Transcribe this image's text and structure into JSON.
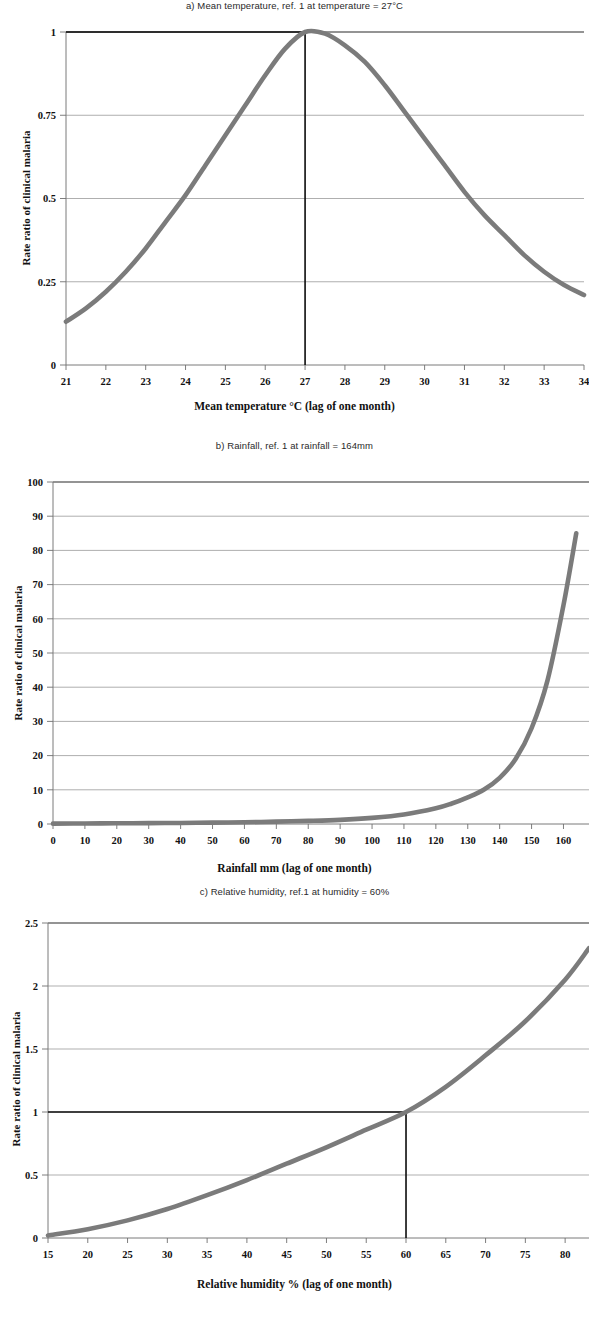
{
  "figure": {
    "panels": [
      {
        "id": "a",
        "title": "a) Mean temperature, ref. 1 at temperature = 27°C",
        "ylabel": "Rate ratio of clinical malaria",
        "xlabel": "Mean temperature °C (lag of one  month)",
        "curve_color": "#7b7b7b"
      },
      {
        "id": "b",
        "title": "b) Rainfall, ref. 1 at rainfall = 164mm",
        "ylabel": "Rate ratio of clinical malaria",
        "xlabel": "Rainfall  mm (lag of one month)",
        "curve_color": "#7b7b7b"
      },
      {
        "id": "c",
        "title": "c) Relative humidity, ref.1 at humidity = 60%",
        "ylabel": "Rate ratio of clinical malaria",
        "xlabel": "Relative humidity % (lag of one month)",
        "curve_color": "#7b7b7b"
      }
    ]
  },
  "chart_data": [
    {
      "type": "line",
      "panel": "a",
      "title": "a) Mean temperature, ref. 1 at temperature = 27°C",
      "xlabel": "Mean temperature °C (lag of one  month)",
      "ylabel": "Rate ratio of clinical malaria",
      "xlim": [
        21,
        34
      ],
      "ylim": [
        0,
        1
      ],
      "xticks": [
        21,
        22,
        23,
        24,
        25,
        26,
        27,
        28,
        29,
        30,
        31,
        32,
        33,
        34
      ],
      "yticks": [
        0,
        0.25,
        0.5,
        0.75,
        1
      ],
      "ytick_labels": [
        "0",
        "0.25",
        "0.5",
        "0.75",
        "1"
      ],
      "grid": "horizontal",
      "legend": "none",
      "reference_lines": {
        "vertical_x": 27,
        "horizontal_y": 1,
        "note": "ref. 1 at temperature = 27°C"
      },
      "x": [
        21,
        21.5,
        22,
        22.5,
        23,
        23.5,
        24,
        24.5,
        25,
        25.5,
        26,
        26.5,
        27,
        27.5,
        28,
        28.5,
        29,
        29.5,
        30,
        30.5,
        31,
        31.5,
        32,
        32.5,
        33,
        33.5,
        34
      ],
      "y": [
        0.13,
        0.17,
        0.22,
        0.28,
        0.35,
        0.43,
        0.51,
        0.6,
        0.69,
        0.78,
        0.87,
        0.95,
        1.0,
        0.995,
        0.96,
        0.91,
        0.84,
        0.76,
        0.68,
        0.6,
        0.52,
        0.45,
        0.39,
        0.33,
        0.28,
        0.24,
        0.21
      ]
    },
    {
      "type": "line",
      "panel": "b",
      "title": "b) Rainfall, ref. 1 at rainfall = 164mm",
      "xlabel": "Rainfall  mm (lag of one month)",
      "ylabel": "Rate ratio of clinical malaria",
      "xlim": [
        0,
        168
      ],
      "ylim": [
        0,
        100
      ],
      "xticks": [
        0,
        10,
        20,
        30,
        40,
        50,
        60,
        70,
        80,
        90,
        100,
        110,
        120,
        130,
        140,
        150,
        160
      ],
      "yticks": [
        0,
        10,
        20,
        30,
        40,
        50,
        60,
        70,
        80,
        90,
        100
      ],
      "ytick_labels": [
        "0",
        "10",
        "20",
        "30",
        "40",
        "50",
        "60",
        "70",
        "80",
        "90",
        "100"
      ],
      "grid": "horizontal",
      "legend": "none",
      "reference_lines": {
        "note": "ref. 1 at rainfall = 164mm"
      },
      "x": [
        0,
        10,
        20,
        30,
        40,
        50,
        60,
        70,
        80,
        90,
        100,
        110,
        120,
        125,
        130,
        135,
        140,
        145,
        150,
        155,
        160,
        164
      ],
      "y": [
        0.1,
        0.15,
        0.2,
        0.25,
        0.3,
        0.4,
        0.5,
        0.7,
        0.9,
        1.2,
        1.8,
        2.8,
        4.6,
        6.0,
        7.8,
        10.0,
        13.5,
        19.0,
        28.0,
        42.0,
        64.0,
        85.0
      ]
    },
    {
      "type": "line",
      "panel": "c",
      "title": "c) Relative humidity, ref.1 at humidity = 60%",
      "xlabel": "Relative humidity % (lag of one month)",
      "ylabel": "Rate ratio of clinical malaria",
      "xlim": [
        15,
        83
      ],
      "ylim": [
        0,
        2.5
      ],
      "xticks": [
        15,
        20,
        25,
        30,
        35,
        40,
        45,
        50,
        55,
        60,
        65,
        70,
        75,
        80
      ],
      "yticks": [
        0,
        0.5,
        1,
        1.5,
        2,
        2.5
      ],
      "ytick_labels": [
        "0",
        "0.5",
        "1",
        "1.5",
        "2",
        "2.5"
      ],
      "grid": "horizontal",
      "legend": "none",
      "reference_lines": {
        "vertical_x": 60,
        "horizontal_y": 1,
        "note": "ref.1 at humidity = 60%"
      },
      "x": [
        15,
        20,
        25,
        30,
        35,
        40,
        45,
        50,
        55,
        60,
        65,
        70,
        75,
        80,
        83
      ],
      "y": [
        0.02,
        0.07,
        0.14,
        0.23,
        0.34,
        0.46,
        0.59,
        0.72,
        0.86,
        1.0,
        1.2,
        1.45,
        1.72,
        2.05,
        2.3
      ]
    }
  ]
}
